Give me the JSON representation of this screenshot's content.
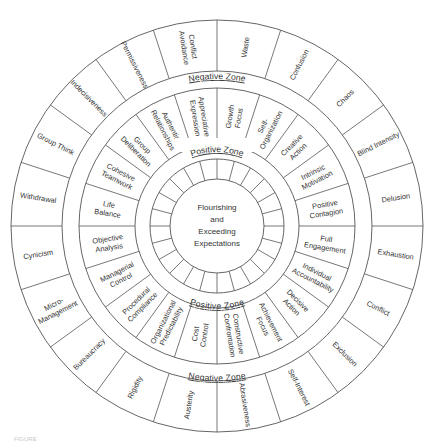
{
  "diagram": {
    "center_label": [
      "Flourishing",
      "and",
      "Exceeding",
      "Expectations"
    ],
    "zones": {
      "inner_positive_label": "Positive Zone",
      "outer_negative_label": "Negative Zone"
    },
    "inner_ring_segment_count": 24,
    "positive_ring": [
      [
        "Growth",
        "Focus"
      ],
      [
        "Self-",
        "Organization"
      ],
      [
        "Creative",
        "Action"
      ],
      [
        "Intrinsic",
        "Motivation"
      ],
      [
        "Positive",
        "Contagion"
      ],
      [
        "Full",
        "Engagement"
      ],
      [
        "Individual",
        "Accountability"
      ],
      [
        "Decisive",
        "Action"
      ],
      [
        "Achievement",
        "Focus"
      ],
      [
        "Constructive",
        "Confrontation"
      ],
      [
        "Cost",
        "Control"
      ],
      [
        "Organizational",
        "Predictability"
      ],
      [
        "Procedural",
        "Compliance"
      ],
      [
        "Managerial",
        "Control"
      ],
      [
        "Objective",
        "Analysis"
      ],
      [
        "Life",
        "Balance"
      ],
      [
        "Cohesive",
        "Teamwork"
      ],
      [
        "Group",
        "Deliberation"
      ],
      [
        "Authentic",
        "Relationships"
      ],
      [
        "Appreciative",
        "Expression"
      ]
    ],
    "negative_ring": [
      [
        "Waste"
      ],
      [
        "Confusion"
      ],
      [
        "Chaos"
      ],
      [
        "Blind Intensity"
      ],
      [
        "Delusion"
      ],
      [
        "Exhaustion"
      ],
      [
        "Conflict"
      ],
      [
        "Exclusion"
      ],
      [
        "Self-Interest"
      ],
      [
        "Abrasiveness"
      ],
      [
        "Austerity"
      ],
      [
        "Rigidity"
      ],
      [
        "Bureaucracy"
      ],
      [
        "Micro-",
        "Management"
      ],
      [
        "Cynicism"
      ],
      [
        "Withdrawal"
      ],
      [
        "Group Think"
      ],
      [
        "Indecisiveness"
      ],
      [
        "Permissiveness"
      ],
      [
        "Conflict",
        "Avoidance"
      ]
    ],
    "colors": {
      "line": "#555555",
      "text": "#333333",
      "background": "#ffffff"
    }
  },
  "caption": "FIGURE"
}
